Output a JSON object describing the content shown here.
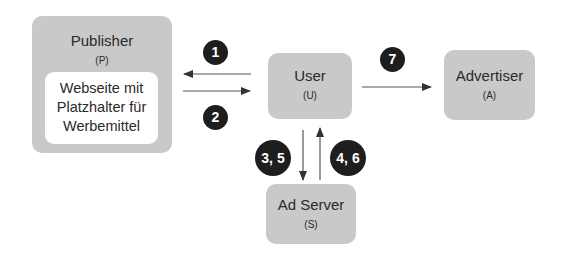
{
  "diagram": {
    "nodes": {
      "publisher": {
        "title": "Publisher",
        "abbr": "(P)",
        "inner_lines": [
          "Webseite mit",
          "Platzhalter für",
          "Werbemittel"
        ]
      },
      "user": {
        "title": "User",
        "abbr": "(U)"
      },
      "advertiser": {
        "title": "Advertiser",
        "abbr": "(A)"
      },
      "adserver": {
        "title": "Ad Server",
        "abbr": "(S)"
      }
    },
    "steps": {
      "s1": "1",
      "s2": "2",
      "s35": "3, 5",
      "s46": "4, 6",
      "s7": "7"
    },
    "edges": [
      {
        "from": "User",
        "to": "Publisher",
        "label": "1"
      },
      {
        "from": "Publisher",
        "to": "User",
        "label": "2"
      },
      {
        "from": "User",
        "to": "Ad Server",
        "label": "3, 5"
      },
      {
        "from": "Ad Server",
        "to": "User",
        "label": "4, 6"
      },
      {
        "from": "User",
        "to": "Advertiser",
        "label": "7"
      }
    ],
    "colors": {
      "node_fill": "#c9c9c9",
      "badge_fill": "#1e1e1e",
      "arrow": "#333333",
      "inner_fill": "#ffffff"
    }
  }
}
